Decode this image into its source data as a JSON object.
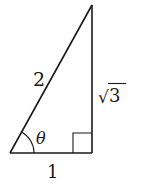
{
  "diagram": {
    "type": "right-triangle",
    "stroke_color": "#1a1a1a",
    "background": "#ffffff",
    "vertices": {
      "bottom_left": [
        10,
        153
      ],
      "bottom_right": [
        92,
        153
      ],
      "top": [
        92,
        5
      ]
    },
    "labels": {
      "hypotenuse": "2",
      "opposite_prefix": "√",
      "opposite_value": "3",
      "adjacent": "1",
      "angle": "θ"
    },
    "right_angle_marker": true,
    "angle_arc_at": "bottom_left"
  }
}
